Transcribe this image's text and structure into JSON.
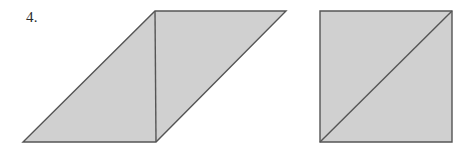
{
  "page": {
    "background_color": "#ffffff",
    "width": 472,
    "height": 153
  },
  "label": {
    "problem_number": "4."
  },
  "style": {
    "fill_color": "#d0d0d0",
    "stroke_color": "#555555",
    "text_color": "#2b2b2b",
    "stroke_width": 1.4
  },
  "figures": [
    {
      "name": "parallelogram",
      "type": "parallelogram",
      "outline_points": "23,142 156,142 286,11 155,11",
      "interior_line": {
        "x1": 155,
        "y1": 11,
        "x2": 156,
        "y2": 142
      },
      "description": "Shaded parallelogram divided by a vertical segment into a left triangle and a right triangle"
    },
    {
      "name": "square",
      "type": "square",
      "outline_points": "320,11 452,11 452,142 320,142",
      "interior_line": {
        "x1": 320,
        "y1": 142,
        "x2": 452,
        "y2": 11
      },
      "description": "Shaded square with a diagonal from bottom-left to top-right"
    }
  ]
}
